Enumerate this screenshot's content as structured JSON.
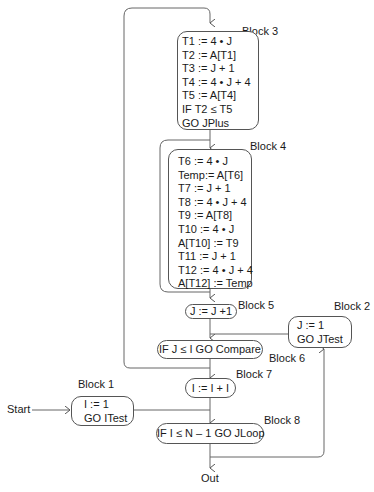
{
  "diagram": {
    "entry_label": "Start",
    "exit_label": "Out",
    "blocks": [
      {
        "id": "block1",
        "title": "Block 1",
        "lines": [
          "I := 1",
          "GO ITest"
        ]
      },
      {
        "id": "block2",
        "title": "Block 2",
        "lines": [
          "J := 1",
          "GO JTest"
        ]
      },
      {
        "id": "block3",
        "title": "Block 3",
        "lines": [
          "T1 := 4 • J",
          "T2 := A[T1]",
          "T3 := J + 1",
          "T4 := 4 • J + 4",
          "T5 := A[T4]",
          "IF T2 ≤ T5",
          "GO JPlus"
        ]
      },
      {
        "id": "block4",
        "title": "Block 4",
        "lines": [
          "T6 := 4 • J",
          "Temp:= A[T6]",
          "T7 := J + 1",
          "T8 := 4  • J + 4",
          "T9 := A[T8]",
          "T10 := 4 • J",
          "A[T10] := T9",
          "T11 := J + 1",
          "T12 := 4 • J + 4",
          "A[T12] := Temp"
        ]
      },
      {
        "id": "block5",
        "title": "Block 5",
        "lines": [
          "J := J +1"
        ]
      },
      {
        "id": "block6",
        "title": "Block 6",
        "lines": [
          "IF J ≤ I GO Compare"
        ]
      },
      {
        "id": "block7",
        "title": "Block 7",
        "lines": [
          "I := I + I"
        ]
      },
      {
        "id": "block8",
        "title": "Block 8",
        "lines": [
          "IF I ≤ N – 1 GO JLoop"
        ]
      }
    ],
    "edges": [
      {
        "from": "Start",
        "to": "block1"
      },
      {
        "from": "block1",
        "to": "block8"
      },
      {
        "from": "block8",
        "to": "Out"
      },
      {
        "from": "block8",
        "to": "block2"
      },
      {
        "from": "block2",
        "to": "block6"
      },
      {
        "from": "block6",
        "to": "block3"
      },
      {
        "from": "block6",
        "to": "block7"
      },
      {
        "from": "block3",
        "to": "block4"
      },
      {
        "from": "block3",
        "to": "block5"
      },
      {
        "from": "block4",
        "to": "block5"
      },
      {
        "from": "block5",
        "to": "block6"
      },
      {
        "from": "block7",
        "to": "block8"
      }
    ]
  }
}
